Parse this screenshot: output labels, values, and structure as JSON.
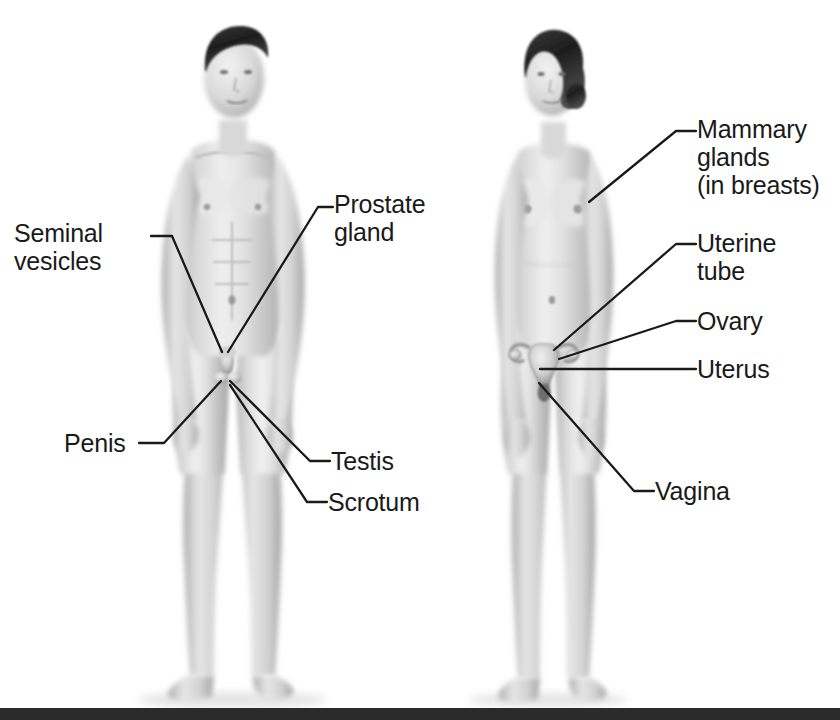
{
  "figure": {
    "background_color": "#ffffff",
    "text_color": "#1a1a1a",
    "leader_line_color": "#1a1a1a",
    "bottom_bar_color": "#2b2b2b"
  },
  "male_figure": {
    "name": "male-body-illustration",
    "description": "Standing nude male figure, front view, grayscale airbrush rendering"
  },
  "female_figure": {
    "name": "female-body-illustration",
    "description": "Standing nude female figure, front view, grayscale airbrush rendering, uterus and ovaries overlaid on pelvis"
  },
  "male_labels": [
    {
      "id": "seminal-vesicles",
      "lines": [
        "Seminal",
        "vesicles"
      ],
      "text": "Seminal vesicles",
      "x": 14,
      "y": 219,
      "elbow": [
        151,
        236
      ],
      "bend": [
        172,
        236
      ],
      "target": [
        222,
        352
      ]
    },
    {
      "id": "prostate-gland",
      "lines": [
        "Prostate",
        "gland"
      ],
      "text": "Prostate gland",
      "x": 334,
      "y": 190,
      "elbow": [
        325,
        207
      ],
      "bend": [
        310,
        207
      ],
      "target": [
        228,
        352
      ]
    },
    {
      "id": "penis",
      "lines": [
        "Penis"
      ],
      "text": "Penis",
      "x": 64,
      "y": 429,
      "elbow": [
        139,
        443
      ],
      "bend": [
        165,
        443
      ],
      "target": [
        222,
        381
      ]
    },
    {
      "id": "testis",
      "lines": [
        "Testis"
      ],
      "text": "Testis",
      "x": 331,
      "y": 447,
      "elbow": [
        323,
        461
      ],
      "bend": [
        305,
        461
      ],
      "target": [
        229,
        381
      ]
    },
    {
      "id": "scrotum",
      "lines": [
        "Scrotum"
      ],
      "text": "Scrotum",
      "x": 328,
      "y": 488,
      "elbow": [
        320,
        502
      ],
      "bend": [
        302,
        502
      ],
      "target": [
        229,
        384
      ]
    }
  ],
  "female_labels": [
    {
      "id": "mammary-glands",
      "lines": [
        "Mammary",
        "glands",
        "(in breasts)"
      ],
      "text": "Mammary glands (in breasts)",
      "x": 697,
      "y": 115,
      "elbow": [
        690,
        131
      ],
      "bend": [
        672,
        131
      ],
      "target": [
        589,
        202
      ]
    },
    {
      "id": "uterine-tube",
      "lines": [
        "Uterine",
        "tube"
      ],
      "text": "Uterine tube",
      "x": 697,
      "y": 229,
      "elbow": [
        690,
        244
      ],
      "bend": [
        672,
        244
      ],
      "target": [
        554,
        350
      ]
    },
    {
      "id": "ovary",
      "lines": [
        "Ovary"
      ],
      "text": "Ovary",
      "x": 697,
      "y": 307,
      "elbow": [
        690,
        321
      ],
      "bend": [
        672,
        321
      ],
      "target": [
        559,
        358
      ]
    },
    {
      "id": "uterus",
      "lines": [
        "Uterus"
      ],
      "text": "Uterus",
      "x": 697,
      "y": 355,
      "elbow": [
        690,
        369
      ],
      "bend": [
        672,
        369
      ],
      "target": [
        540,
        369
      ]
    },
    {
      "id": "vagina",
      "lines": [
        "Vagina"
      ],
      "text": "Vagina",
      "x": 655,
      "y": 477,
      "elbow": [
        648,
        491
      ],
      "bend": [
        630,
        491
      ],
      "target": [
        538,
        383
      ]
    }
  ],
  "bottom_bar": {
    "name": "bottom-rule",
    "top": 708,
    "height": 12
  }
}
